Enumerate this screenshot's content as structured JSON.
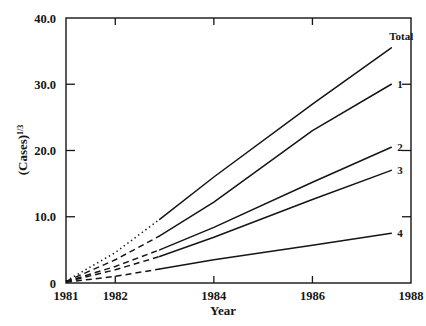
{
  "chart_data": {
    "type": "line",
    "title": "",
    "xlabel": "Year",
    "ylabel": "(Cases)1/3",
    "ylabel_base": "(Cases)",
    "ylabel_exponent": "1/3",
    "xlim": [
      1981,
      1988
    ],
    "ylim": [
      0,
      40
    ],
    "grid": false,
    "legend_position": "inline-right-end",
    "xticks": [
      1981,
      1982,
      1984,
      1986,
      1988
    ],
    "xtick_labels": [
      "1981",
      "1982",
      "1984",
      "1986",
      "1988"
    ],
    "yticks": [
      0,
      10,
      20,
      30,
      40
    ],
    "ytick_labels": [
      "0",
      "10.0",
      "20.0",
      "30.0",
      "40.0"
    ],
    "projected_until": 1982.9,
    "series": [
      {
        "name": "Total",
        "label": "Total",
        "style_projected": "dotted",
        "style_observed": "solid",
        "x": [
          1981,
          1982,
          1982.9,
          1984,
          1986,
          1987.6
        ],
        "values": [
          0.3,
          4.6,
          9.6,
          16.0,
          27.0,
          35.5
        ]
      },
      {
        "name": "1",
        "label": "1",
        "style_projected": "dashed",
        "style_observed": "solid",
        "x": [
          1981,
          1982,
          1982.9,
          1984,
          1986,
          1987.6
        ],
        "values": [
          0.25,
          3.5,
          7.1,
          12.2,
          23.0,
          30.0
        ]
      },
      {
        "name": "2",
        "label": "2",
        "style_projected": "dashed",
        "style_observed": "solid",
        "x": [
          1981,
          1982,
          1982.9,
          1984,
          1986,
          1987.6
        ],
        "values": [
          0.2,
          2.5,
          5.0,
          8.4,
          15.2,
          20.5
        ]
      },
      {
        "name": "3",
        "label": "3",
        "style_projected": "dashed",
        "style_observed": "solid",
        "x": [
          1981,
          1982,
          1982.9,
          1984,
          1986,
          1987.6
        ],
        "values": [
          0.18,
          2.0,
          4.0,
          6.9,
          12.6,
          17.0
        ]
      },
      {
        "name": "4",
        "label": "4",
        "style_projected": "dashed",
        "style_observed": "solid",
        "x": [
          1981,
          1982,
          1982.9,
          1984,
          1986,
          1987.6
        ],
        "values": [
          0.12,
          1.0,
          2.1,
          3.5,
          5.7,
          7.5
        ]
      }
    ],
    "colors": {
      "line": "#151515",
      "axis": "#151515",
      "text": "#151515",
      "background": "#ffffff"
    }
  }
}
